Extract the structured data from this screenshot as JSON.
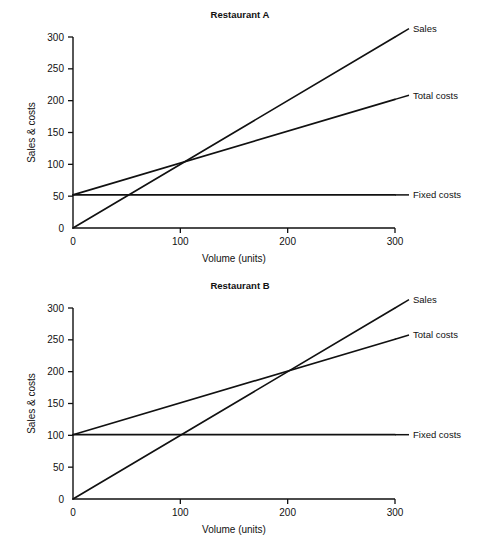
{
  "page": {
    "background_color": "#ffffff",
    "line_color": "#111111"
  },
  "chart_data": [
    {
      "id": "restaurant-a",
      "type": "line",
      "title": "Restaurant A",
      "xlabel": "Volume (units)",
      "ylabel": "Sales & costs",
      "xlim": [
        0,
        300
      ],
      "ylim": [
        0,
        300
      ],
      "xticks": [
        0,
        100,
        200,
        300
      ],
      "xtick_labels": [
        "0",
        "100",
        "200",
        "300"
      ],
      "yticks": [
        0,
        50,
        100,
        150,
        200,
        250,
        300
      ],
      "ytick_labels": [
        "0",
        "50",
        "100",
        "150",
        "200",
        "250",
        "300"
      ],
      "grid": false,
      "legend_position": "right-inline-labels",
      "series": [
        {
          "name": "Sales",
          "label": "Sales",
          "x": [
            0,
            300
          ],
          "values": [
            0,
            300
          ]
        },
        {
          "name": "Total costs",
          "label": "Total costs",
          "x": [
            0,
            300
          ],
          "values": [
            52,
            202
          ]
        },
        {
          "name": "Fixed costs",
          "label": "Fixed costs",
          "x": [
            0,
            300
          ],
          "values": [
            52,
            52
          ]
        }
      ],
      "breakeven": {
        "x": 100,
        "y": 100
      }
    },
    {
      "id": "restaurant-b",
      "type": "line",
      "title": "Restaurant B",
      "xlabel": "Volume (units)",
      "ylabel": "Sales & costs",
      "xlim": [
        0,
        300
      ],
      "ylim": [
        0,
        300
      ],
      "xticks": [
        0,
        100,
        200,
        300
      ],
      "xtick_labels": [
        "0",
        "100",
        "200",
        "300"
      ],
      "yticks": [
        0,
        50,
        100,
        150,
        200,
        250,
        300
      ],
      "ytick_labels": [
        "0",
        "50",
        "100",
        "150",
        "200",
        "250",
        "300"
      ],
      "grid": false,
      "legend_position": "right-inline-labels",
      "series": [
        {
          "name": "Sales",
          "label": "Sales",
          "x": [
            0,
            300
          ],
          "values": [
            0,
            300
          ]
        },
        {
          "name": "Total costs",
          "label": "Total costs",
          "x": [
            0,
            300
          ],
          "values": [
            101,
            251
          ]
        },
        {
          "name": "Fixed costs",
          "label": "Fixed costs",
          "x": [
            0,
            300
          ],
          "values": [
            101,
            101
          ]
        }
      ],
      "breakeven": {
        "x": 200,
        "y": 200
      }
    }
  ]
}
